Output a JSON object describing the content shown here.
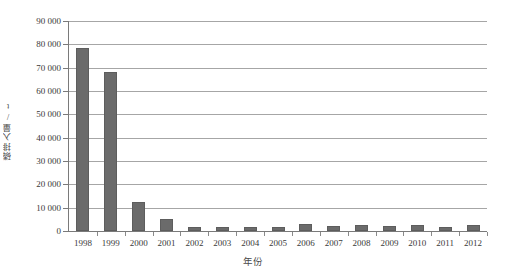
{
  "chart_data": {
    "type": "bar",
    "title": "",
    "subtitle": "",
    "xlabel": "年份",
    "ylabel": "磷排入量/t",
    "categories": [
      "1998",
      "1999",
      "2000",
      "2001",
      "2002",
      "2003",
      "2004",
      "2005",
      "2006",
      "2007",
      "2008",
      "2009",
      "2010",
      "2011",
      "2012"
    ],
    "values": [
      78500,
      68300,
      12500,
      5000,
      1800,
      1700,
      1600,
      1700,
      3000,
      2200,
      2600,
      2100,
      2400,
      1900,
      2600
    ],
    "series": [
      {
        "name": "磷排入量",
        "values": [
          78500,
          68300,
          12500,
          5000,
          1800,
          1700,
          1600,
          1700,
          3000,
          2200,
          2600,
          2100,
          2400,
          1900,
          2600
        ]
      }
    ],
    "ylim": [
      0,
      90000
    ],
    "ytick_values": [
      0,
      10000,
      20000,
      30000,
      40000,
      50000,
      60000,
      70000,
      80000,
      90000
    ],
    "ytick_labels": [
      "0",
      "10 000",
      "20 000",
      "30 000",
      "40 000",
      "50 000",
      "60 000",
      "70 000",
      "80 000",
      "90 000"
    ],
    "grid": "horizontal",
    "legend": "none",
    "bar_color": "#6b6b6b",
    "gridline_color": "#a6a6a6",
    "axis_color": "#7a7a7a"
  }
}
